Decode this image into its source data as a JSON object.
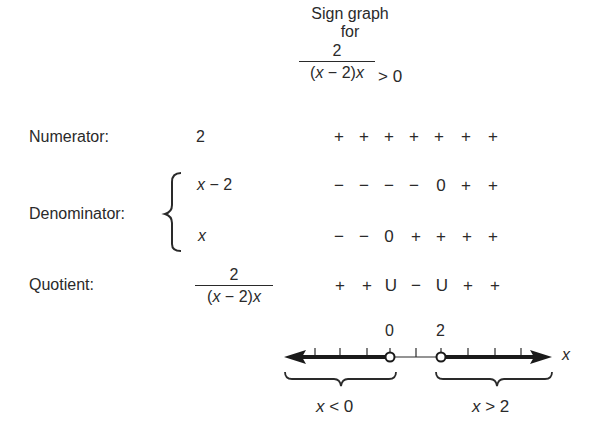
{
  "header": {
    "title_line1": "Sign graph",
    "title_line2": "for",
    "inequality": {
      "numerator": "2",
      "denominator_open": "(",
      "denominator_x1": "x",
      "denominator_mid": " − 2)",
      "denominator_x2": "x",
      "relation": "> 0"
    }
  },
  "rows": [
    {
      "label": "Numerator:",
      "expression": "2",
      "signs": [
        "+",
        "+",
        "+",
        "+",
        "+",
        "+",
        "+"
      ]
    },
    {
      "label": "Denominator:",
      "factors": [
        {
          "expression_var": "x",
          "expression_rest": " − 2",
          "signs": [
            "−",
            "−",
            "−",
            "−",
            "0",
            "+",
            "+"
          ]
        },
        {
          "expression_var": "x",
          "expression_rest": "",
          "signs": [
            "−",
            "−",
            "0",
            "+",
            "+",
            "+",
            "+"
          ]
        }
      ]
    },
    {
      "label": "Quotient:",
      "expression": {
        "numerator": "2",
        "denominator_open": "(",
        "denominator_x1": "x",
        "denominator_mid": " − 2)",
        "denominator_x2": "x"
      },
      "signs": [
        "+",
        "+",
        "U",
        "−",
        "U",
        "+",
        "+"
      ]
    }
  ],
  "number_line": {
    "axis_label": "x",
    "points": [
      {
        "value": "0",
        "open": true
      },
      {
        "value": "2",
        "open": true
      }
    ],
    "solution_intervals": [
      {
        "var": "x",
        "relation": " < 0"
      },
      {
        "var": "x",
        "relation": " > 2"
      }
    ]
  }
}
